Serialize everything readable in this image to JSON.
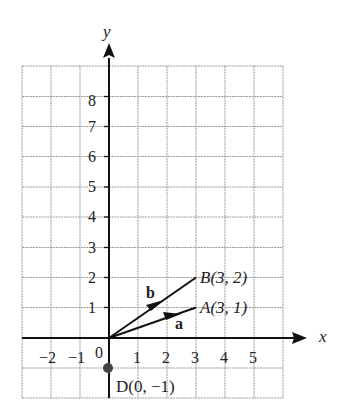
{
  "axes": {
    "x_label": "x",
    "y_label": "y",
    "x_ticks": [
      "−2",
      "−1",
      "1",
      "2",
      "3",
      "4",
      "5"
    ],
    "y_ticks": [
      "1",
      "2",
      "3",
      "4",
      "5",
      "6",
      "7",
      "8"
    ],
    "origin_label": "0"
  },
  "points": {
    "A": "A(3, 1)",
    "B": "B(3, 2)",
    "D": "D(0, −1)"
  },
  "vectors": {
    "a": "a",
    "b": "b"
  },
  "colors": {
    "grid": "#9a9a9a",
    "axis": "#111111",
    "text": "#222222"
  }
}
